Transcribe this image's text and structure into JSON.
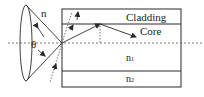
{
  "diagram": {
    "labels": {
      "outer_medium": "n",
      "angle": "θ",
      "cladding": "Cladding",
      "core": "Core",
      "n1_base": "n",
      "n1_sub": "1",
      "n2_base": "n",
      "n2_sub": "2"
    },
    "colors": {
      "stroke": "#2a2a2a",
      "dotted": "#555555",
      "background": "#ffffff"
    }
  }
}
